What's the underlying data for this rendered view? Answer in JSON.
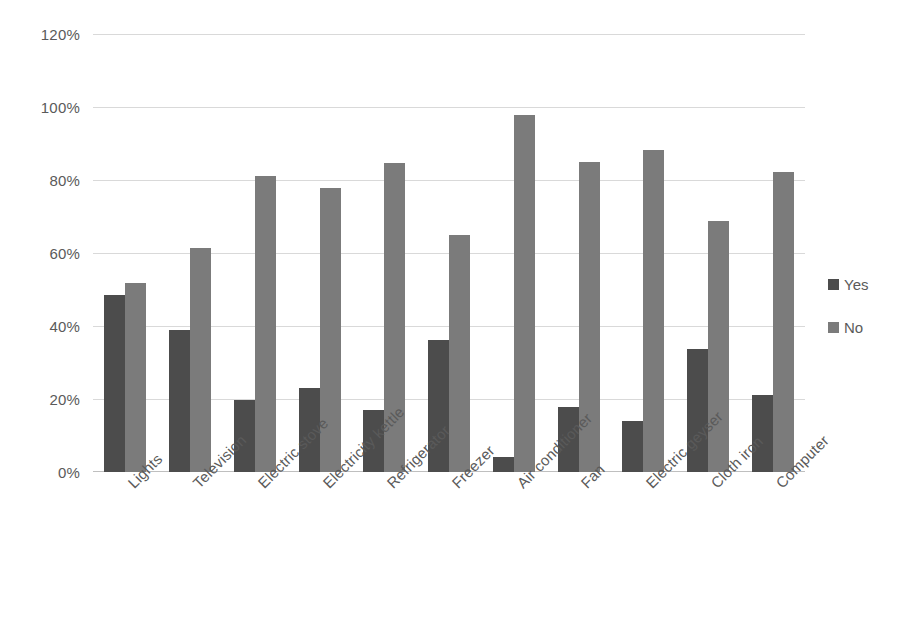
{
  "chart_data": {
    "type": "bar",
    "title": "",
    "subtitle": "",
    "xlabel": "",
    "ylabel": "",
    "ylim": [
      0,
      120
    ],
    "y_tick_labels": [
      "0%",
      "20%",
      "40%",
      "60%",
      "80%",
      "100%",
      "120%"
    ],
    "y_ticks": [
      0,
      20,
      40,
      60,
      80,
      100,
      120
    ],
    "grid": true,
    "legend_position": "right",
    "categories": [
      "Lights",
      "Television",
      "Electric stove",
      "Electricity kettle",
      "Refrigerator",
      "Freezer",
      "Air conditioner",
      "Fan",
      "Electric geyser",
      "Cloth iron",
      "Computer"
    ],
    "series": [
      {
        "name": "Yes",
        "color": "#4c4c4c",
        "values": [
          48.5,
          39,
          19.8,
          23,
          17,
          36.3,
          4.2,
          17.7,
          14,
          33.7,
          21
        ]
      },
      {
        "name": "No",
        "color": "#7b7b7b",
        "values": [
          51.8,
          61.4,
          81,
          77.7,
          84.7,
          64.8,
          97.8,
          84.8,
          88.2,
          68.7,
          82.2
        ]
      }
    ]
  },
  "legend": {
    "items": [
      {
        "label": "Yes",
        "color": "#4c4c4c"
      },
      {
        "label": "No",
        "color": "#7b7b7b"
      }
    ]
  }
}
